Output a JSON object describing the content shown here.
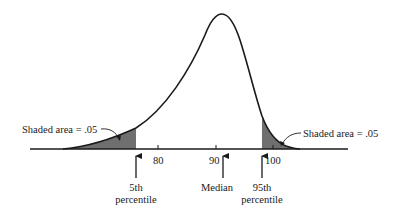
{
  "diagram": {
    "type": "left-skewed distribution curve with shaded tails",
    "colors": {
      "curve": "#1a1a1a",
      "shade": "#6f6f6f",
      "axis": "#1a1a1a",
      "text": "#1a1a1a"
    },
    "axis": {
      "ticks": [
        {
          "value": "80"
        },
        {
          "value": "90"
        },
        {
          "value": "100"
        }
      ]
    },
    "annotations": {
      "left_shade_label": "Shaded area = .05",
      "right_shade_label": "Shaded area = .05"
    },
    "markers": [
      {
        "line1": "5th",
        "line2": "percentile"
      },
      {
        "line1": "Median",
        "line2": ""
      },
      {
        "line1": "95th",
        "line2": "percentile"
      }
    ]
  }
}
